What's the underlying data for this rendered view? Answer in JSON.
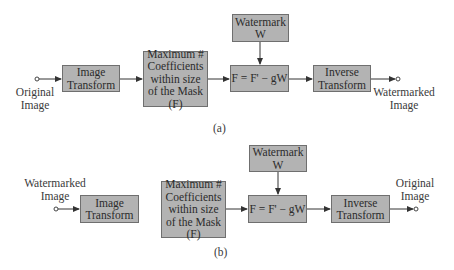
{
  "diagram_a": {
    "caption": "(a)",
    "input_label": "Original Image",
    "output_label": "Watermarked Image",
    "blocks": {
      "image_transform": "Image Transform",
      "max_coefficients": "Maximum # Coefficients within size of the Mask (F)",
      "watermark": "Watermark W",
      "embed_formula": "F = F' − gW",
      "inverse_transform": "Inverse Transform"
    }
  },
  "diagram_b": {
    "caption": "(b)",
    "input_label": "Watermarked Image",
    "output_label": "Original Image",
    "blocks": {
      "image_transform": "Image Transform",
      "max_coefficients": "Maximum # Coefficients within size of the Mask (F)",
      "watermark": "Watermark W",
      "embed_formula": "F = F' − gW",
      "inverse_transform": "Inverse Transform"
    }
  },
  "colors": {
    "block_fill": "#b3b3b3",
    "block_border": "#6f6f6f",
    "line": "#333333"
  }
}
